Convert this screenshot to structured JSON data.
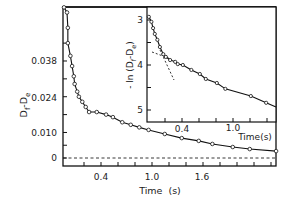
{
  "chart_data": [
    {
      "type": "line",
      "title": "",
      "xlabel": "Time  (s)",
      "ylabel": "D_f - D_e",
      "xlim": [
        0,
        2.45
      ],
      "ylim": [
        -0.003,
        0.059
      ],
      "xticks": [
        0.4,
        1.0,
        1.6
      ],
      "xtick_labels": [
        "0.4",
        "1.0",
        "1.6"
      ],
      "yticks": [
        0,
        0.01,
        0.024,
        0.038
      ],
      "ytick_labels": [
        "0",
        "0.010",
        "0.024",
        "0.038"
      ],
      "grid": false,
      "markers": "open-circle",
      "reference_line": {
        "y": 0,
        "style": "dashed"
      },
      "series": [
        {
          "name": "D_f - D_e",
          "x": [
            0.0,
            0.0,
            0.01,
            0.01,
            0.04,
            0.06,
            0.08,
            0.09,
            0.12,
            0.14,
            0.18,
            0.22,
            0.26,
            0.35,
            0.46,
            0.54,
            0.65,
            0.75,
            0.85,
            0.96,
            1.15,
            1.35,
            1.55,
            1.71,
            1.95,
            2.15,
            2.46
          ],
          "y": [
            0.059,
            0.057,
            0.051,
            0.045,
            0.04,
            0.036,
            0.032,
            0.029,
            0.026,
            0.024,
            0.022,
            0.02,
            0.018,
            0.018,
            0.017,
            0.016,
            0.014,
            0.013,
            0.012,
            0.011,
            0.0094,
            0.0078,
            0.0067,
            0.0055,
            0.0043,
            0.0035,
            0.0027
          ]
        }
      ]
    },
    {
      "type": "line",
      "title": "inset",
      "xlabel": "Time(s)",
      "ylabel": "- ln (D_f - D_e)",
      "xlim": [
        0,
        1.5
      ],
      "ylim": [
        2.85,
        5.25
      ],
      "xticks": [
        0.4,
        1.0
      ],
      "xtick_labels": [
        "0.4",
        "1.0"
      ],
      "yticks": [
        3,
        4,
        5
      ],
      "ytick_labels": [
        "3",
        "4",
        "5"
      ],
      "y_inverted": true,
      "grid": false,
      "markers": "open-circle",
      "series": [
        {
          "name": "-ln(D_f - D_e)",
          "x": [
            0.01,
            0.04,
            0.06,
            0.08,
            0.11,
            0.14,
            0.18,
            0.21,
            0.26,
            0.32,
            0.35,
            0.41,
            0.51,
            0.61,
            0.68,
            0.81,
            0.91,
            1.21,
            1.39
          ],
          "y": [
            2.93,
            3.04,
            3.18,
            3.31,
            3.44,
            3.6,
            3.76,
            3.82,
            3.89,
            3.93,
            3.98,
            4.0,
            4.11,
            4.2,
            4.31,
            4.4,
            4.53,
            4.69,
            4.84
          ]
        },
        {
          "name": "fast-component fit (dashed)",
          "x": [
            0.14,
            0.29
          ],
          "y": [
            3.67,
            4.29
          ]
        },
        {
          "name": "slow-component fit (dashed)",
          "x": [
            0.05,
            0.26
          ],
          "y": [
            3.71,
            3.87
          ]
        },
        {
          "name": "fit line (solid)",
          "x": [
            0.0,
            1.5
          ],
          "y": [
            2.9,
            4.93
          ]
        }
      ]
    }
  ],
  "main": {
    "ylabel_main": "D",
    "ylabel_sub1": "f",
    "ylabel_mid": "-D",
    "ylabel_sub2": "e",
    "xlabel": "Time  (s)",
    "yticks": [
      "0.038",
      "0.024",
      "0.010",
      "0"
    ],
    "xticks": [
      "0.4",
      "1.0",
      "1.6"
    ]
  },
  "inset": {
    "ylabel_pre": "- ln (D",
    "ylabel_sub1": "f",
    "ylabel_mid": "-D",
    "ylabel_sub2": "e",
    "ylabel_post": ")",
    "xlabel": "Time(s)",
    "yticks": [
      "3",
      "4",
      "5"
    ],
    "xticks": [
      "0.4",
      "1.0"
    ]
  }
}
